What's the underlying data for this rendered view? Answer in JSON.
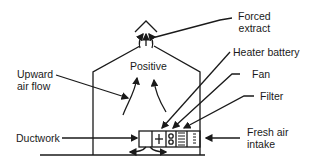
{
  "diagram": {
    "center_label": "Positive",
    "labels": {
      "forced_extract_1": "Forced",
      "forced_extract_2": "extract",
      "heater_battery": "Heater battery",
      "fan": "Fan",
      "filter": "Filter",
      "upward_air_flow_1": "Upward",
      "upward_air_flow_2": "air flow",
      "ductwork": "Ductwork",
      "fresh_air_intake_1": "Fresh air",
      "fresh_air_intake_2": "intake"
    },
    "components": [
      "Ductwork",
      "Heater battery",
      "Fan",
      "Filter",
      "Fresh air intake",
      "Forced extract"
    ],
    "colors": {
      "line": "#1a1a1a",
      "background": "#ffffff"
    }
  }
}
